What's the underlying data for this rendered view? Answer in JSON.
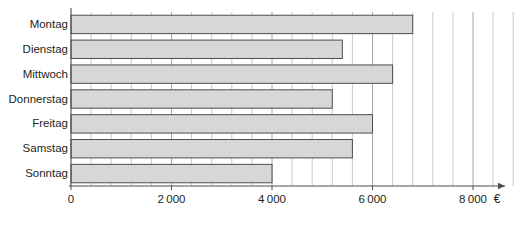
{
  "chart_data": {
    "type": "bar",
    "orientation": "horizontal",
    "title": "",
    "subtitle": "",
    "xlabel": "€",
    "ylabel": "",
    "categories": [
      "Montag",
      "Dienstag",
      "Mittwoch",
      "Donnerstag",
      "Freitag",
      "Samstag",
      "Sonntag"
    ],
    "values": [
      6800,
      5400,
      6400,
      5200,
      6000,
      5600,
      4000
    ],
    "series": [
      {
        "name": "Umsatz",
        "values": [
          6800,
          5400,
          6400,
          5200,
          6000,
          5600,
          4000
        ]
      }
    ],
    "xlim": [
      0,
      8800
    ],
    "x_major_ticks": [
      0,
      2000,
      4000,
      6000,
      8000
    ],
    "x_major_tick_labels": [
      "0",
      "2000",
      "4000",
      "6000",
      "8000"
    ],
    "x_minor_step": 400,
    "grid": "vertical",
    "legend": "none",
    "bar_color": "#d7d7d7",
    "bar_border_color": "#4d4d4d",
    "axis_color": "#4d4d4d",
    "gridline_color": "#bdbdbd",
    "unit_symbol": "€",
    "annotations": []
  },
  "axis": {
    "arrow_end": "right"
  }
}
